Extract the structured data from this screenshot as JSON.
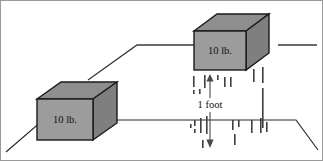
{
  "figure": {
    "canvas": {
      "width": 323,
      "height": 161,
      "background": "#ffffff"
    },
    "palette": {
      "cube_front": "#9c9c9c",
      "cube_top": "#8e8e8e",
      "cube_side": "#7f7f7f",
      "outline": "#1a1a1a",
      "line": "#3a3a3a",
      "text": "#111111",
      "arrow": "#4a4a4a",
      "frame": "#9a9a9a"
    },
    "labels": {
      "lower_block_weight": "10 lb.",
      "upper_block_weight": "10 lb.",
      "height_measure": "1 foot"
    },
    "blocks": [
      {
        "name": "lower-block",
        "weight_label": "10 lb.",
        "position": "ground-level-left",
        "front": {
          "x": 37,
          "y": 99,
          "w": 56,
          "h": 41
        },
        "depth": {
          "dx": 24,
          "dy": -17
        }
      },
      {
        "name": "upper-block",
        "weight_label": "10 lb.",
        "position": "platform-level-right",
        "front": {
          "x": 194,
          "y": 31,
          "w": 52,
          "h": 39
        },
        "depth": {
          "dx": 23,
          "dy": -17
        }
      }
    ],
    "measurement": {
      "label": "1 foot",
      "label_x": 210,
      "label_y": 105,
      "top_y": 74,
      "bottom_y": 148,
      "axis_x": 210,
      "gap_top": 98,
      "gap_bottom": 112
    },
    "ground": {
      "name": "ground-plane",
      "points": "6,152 43,120 296,120 318,150"
    },
    "platform": {
      "name": "upper-platform",
      "points": "88,80 137,45 258,45"
    },
    "right_stub": {
      "name": "right-platform-stub",
      "x1": 278,
      "y1": 45,
      "x2": 317,
      "y2": 45
    },
    "dashes": [
      {
        "x": 193,
        "y": 76,
        "h": 11
      },
      {
        "x": 193,
        "y": 90,
        "h": 4
      },
      {
        "x": 199,
        "y": 89,
        "h": 5
      },
      {
        "x": 204,
        "y": 75,
        "h": 13
      },
      {
        "x": 217,
        "y": 75,
        "h": 5
      },
      {
        "x": 224,
        "y": 77,
        "h": 10
      },
      {
        "x": 230,
        "y": 77,
        "h": 10
      },
      {
        "x": 253,
        "y": 69,
        "h": 13
      },
      {
        "x": 262,
        "y": 67,
        "h": 16
      },
      {
        "x": 194,
        "y": 120,
        "h": 6
      },
      {
        "x": 194,
        "y": 129,
        "h": 4
      },
      {
        "x": 200,
        "y": 118,
        "h": 15
      },
      {
        "x": 206,
        "y": 116,
        "h": 18
      },
      {
        "x": 190,
        "y": 124,
        "h": 4
      },
      {
        "x": 202,
        "y": 140,
        "h": 8
      },
      {
        "x": 232,
        "y": 120,
        "h": 10
      },
      {
        "x": 238,
        "y": 120,
        "h": 7
      },
      {
        "x": 234,
        "y": 134,
        "h": 11
      },
      {
        "x": 251,
        "y": 120,
        "h": 13
      },
      {
        "x": 260,
        "y": 118,
        "h": 15
      },
      {
        "x": 266,
        "y": 122,
        "h": 10
      },
      {
        "x": 262,
        "y": 88,
        "h": 40
      }
    ]
  }
}
